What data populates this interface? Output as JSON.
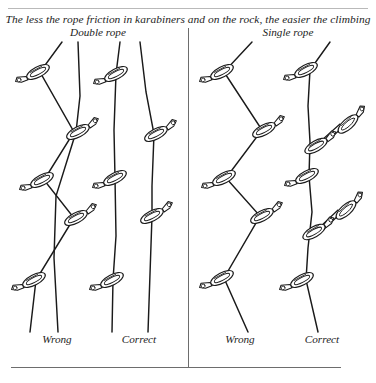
{
  "figure": {
    "caption": "The less the rope friction in karabiners and on the rock, the easier the climbing",
    "headings": {
      "left": "Double rope",
      "right": "Single rope"
    },
    "footers": {
      "panel1": "Wrong",
      "panel2": "Correct",
      "panel3": "Wrong",
      "panel4": "Correct"
    },
    "colors": {
      "ink": "#1a1a1a",
      "rule": "#6d6d6d",
      "rule_light": "#b9b9b9",
      "paper": "#ffffff"
    }
  },
  "panels": [
    {
      "id": "panel-1",
      "label": "Wrong",
      "group": "Double rope",
      "rope_count": 2,
      "karabiner_count": 5,
      "description": "Two ropes zig-zag across each other through alternating left and right karabiners, creating rope crossing and high friction",
      "karabiners": [
        {
          "x": 38,
          "y": 72,
          "side": "left",
          "angle": -28
        },
        {
          "x": 78,
          "y": 132,
          "side": "right",
          "angle": -28
        },
        {
          "x": 42,
          "y": 180,
          "side": "left",
          "angle": -28
        },
        {
          "x": 76,
          "y": 218,
          "side": "right",
          "angle": -28
        },
        {
          "x": 34,
          "y": 280,
          "side": "left",
          "angle": -28
        }
      ]
    },
    {
      "id": "panel-2",
      "label": "Correct",
      "group": "Double rope",
      "rope_count": 2,
      "karabiner_count": 5,
      "description": "Two ropes run nearly straight and parallel; the left rope clips only left karabiners and the right rope only right karabiners, so the ropes never cross",
      "karabiners": [
        {
          "x": 116,
          "y": 74,
          "side": "left",
          "angle": -28
        },
        {
          "x": 156,
          "y": 134,
          "side": "right",
          "angle": -28
        },
        {
          "x": 115,
          "y": 178,
          "side": "left",
          "angle": -28
        },
        {
          "x": 152,
          "y": 216,
          "side": "right",
          "angle": -28
        },
        {
          "x": 112,
          "y": 280,
          "side": "left",
          "angle": -28
        }
      ]
    },
    {
      "id": "panel-3",
      "label": "Wrong",
      "group": "Single rope",
      "rope_count": 1,
      "karabiner_count": 5,
      "description": "A single rope zig-zags sharply from side to side through alternating karabiners, producing maximum rope drag",
      "karabiners": [
        {
          "x": 222,
          "y": 72,
          "side": "left",
          "angle": -28
        },
        {
          "x": 264,
          "y": 130,
          "side": "right",
          "angle": -28
        },
        {
          "x": 224,
          "y": 178,
          "side": "left",
          "angle": -28
        },
        {
          "x": 262,
          "y": 216,
          "side": "right",
          "angle": -28
        },
        {
          "x": 222,
          "y": 278,
          "side": "left",
          "angle": -28
        }
      ]
    },
    {
      "id": "panel-4",
      "label": "Correct",
      "group": "Single rope",
      "rope_count": 1,
      "karabiner_count": 5,
      "description": "A single rope runs almost straight; offset bolts are reached with extended slings or quickdraws so the rope line stays direct and friction stays low",
      "karabiners": [
        {
          "x": 306,
          "y": 70,
          "side": "left",
          "angle": -28
        },
        {
          "x": 348,
          "y": 124,
          "side": "right",
          "angle": -30,
          "extended": true
        },
        {
          "x": 307,
          "y": 176,
          "side": "left",
          "angle": -28
        },
        {
          "x": 346,
          "y": 210,
          "side": "right",
          "angle": -30,
          "extended": true
        },
        {
          "x": 302,
          "y": 280,
          "side": "left",
          "angle": -28
        }
      ],
      "slings": 2
    }
  ]
}
